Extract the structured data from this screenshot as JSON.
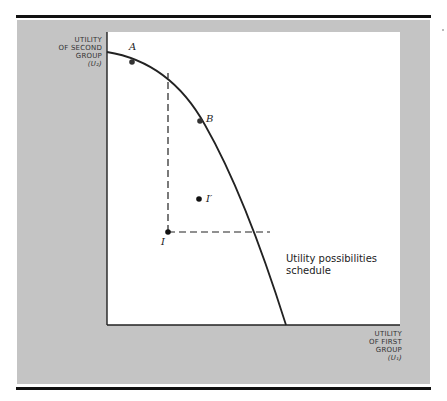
{
  "figure": {
    "y_axis_label": [
      "UTILITY",
      "OF SECOND",
      "GROUP",
      "(U₂)"
    ],
    "x_axis_label": [
      "UTILITY",
      "OF FIRST",
      "GROUP",
      "(U₁)"
    ],
    "curve_label": [
      "Utility possibilities",
      "schedule"
    ],
    "points": [
      {
        "label": "A",
        "desc": "point on frontier"
      },
      {
        "label": "B",
        "desc": "point on frontier"
      },
      {
        "label": "I",
        "desc": "initial point"
      },
      {
        "label": "I′",
        "desc": "alternative point"
      }
    ],
    "colors": {
      "panel": "#c4c4c4",
      "plot": "#ffffff",
      "ink": "#222222"
    }
  }
}
